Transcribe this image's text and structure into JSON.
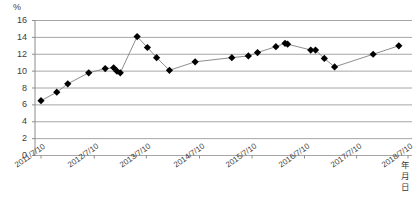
{
  "chart_data": {
    "type": "line",
    "title": "",
    "subtitle": "",
    "xlabel": "年月日",
    "ylabel": "%",
    "ylim": [
      0,
      16
    ],
    "ytick_step": 2,
    "yticks": [
      "16",
      "14",
      "12",
      "10",
      "8",
      "6",
      "4",
      "2",
      "0"
    ],
    "grid": true,
    "legend": "none",
    "marker": "diamond",
    "marker_color": "#000000",
    "line_color": "#808080",
    "grid_color": "#a6a6a6",
    "xticks": [
      "2011/7/10",
      "2012/7/10",
      "2013/7/10",
      "2014/7/10",
      "2015/7/10",
      "2016/7/10",
      "2017/7/10",
      "2018/7/10"
    ],
    "x": [
      "2011/7/10",
      "2011/10/10",
      "2011/12/10",
      "2012/4/10",
      "2012/8/10",
      "2012/10/10",
      "2012/11/10",
      "2012/12/10",
      "2013/3/10",
      "2013/5/10",
      "2013/7/10",
      "2013/10/10",
      "2014/5/10",
      "2015/4/10",
      "2015/8/10",
      "2015/10/10",
      "2016/2/10",
      "2016/4/10",
      "2016/5/10",
      "2017/1/10",
      "2017/2/10",
      "2017/4/10",
      "2017/7/10",
      "2018/6/10",
      "2018/12/10"
    ],
    "values": [
      6.5,
      7.5,
      8.5,
      9.8,
      10.3,
      10.4,
      10.0,
      9.8,
      14.1,
      12.8,
      11.6,
      10.1,
      11.1,
      11.6,
      11.8,
      12.2,
      12.9,
      13.3,
      13.2,
      12.5,
      12.5,
      11.5,
      10.5,
      12.0,
      13.0
    ]
  }
}
